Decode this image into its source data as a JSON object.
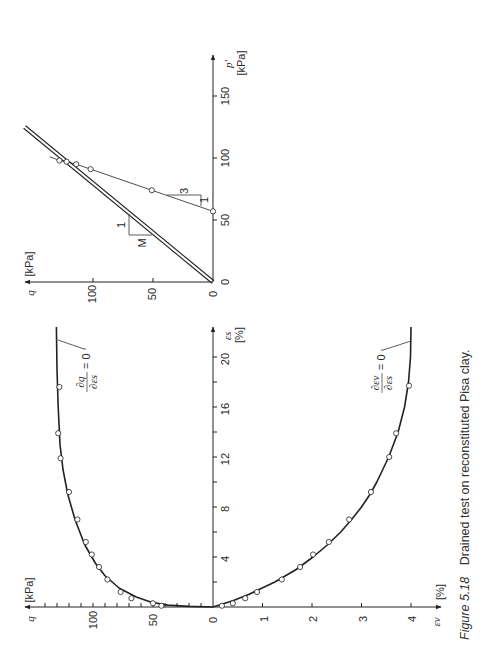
{
  "figure": {
    "caption_number": "Figure 5.18",
    "caption_text": "Drained test on reconstituted Pisa clay.",
    "colors": {
      "ink": "#222222",
      "background": "#ffffff"
    }
  },
  "chart_data": [
    {
      "id": "stress_path",
      "type": "line",
      "title": "",
      "xlabel": "p'",
      "xunit": "[kPa]",
      "ylabel": "q",
      "yunit": "[kPa]",
      "xlim": [
        0,
        175
      ],
      "ylim": [
        0,
        160
      ],
      "x_ticks": [
        0,
        50,
        100,
        150
      ],
      "y_ticks": [
        0,
        50,
        100
      ],
      "grid": false,
      "orientation_note": "figure rotated 90°; p' axis drawn vertical, q axis horizontal",
      "series": [
        {
          "name": "stress path (data)",
          "style": "markers+line",
          "points": [
            {
              "p": 57,
              "q": 0
            },
            {
              "p": 74,
              "q": 51
            },
            {
              "p": 91,
              "q": 102
            },
            {
              "p": 95,
              "q": 114
            },
            {
              "p": 97,
              "q": 122
            },
            {
              "p": 98,
              "q": 128
            }
          ],
          "line_extension_end": {
            "p": 101,
            "q": 136
          }
        },
        {
          "name": "critical state line",
          "style": "double-line",
          "points": [
            {
              "p": 0,
              "q": 0
            },
            {
              "p": 125,
              "q": 157
            }
          ]
        }
      ],
      "annotations": [
        {
          "type": "slope-triangle",
          "label_run": "1",
          "label_rise": "M",
          "slope": "M"
        },
        {
          "type": "slope-triangle",
          "label_run": "1",
          "label_rise": "3",
          "slope": "3"
        }
      ]
    },
    {
      "id": "q_vs_es",
      "type": "line",
      "xlabel": "εs",
      "xunit": "[%]",
      "ylabel": "q",
      "yunit": "[kPa]",
      "xlim": [
        0,
        22.5
      ],
      "ylim": [
        0,
        140
      ],
      "x_ticks": [
        0,
        4,
        8,
        12,
        16,
        20
      ],
      "x_minor_ticks": [
        2,
        6,
        10,
        14,
        18
      ],
      "y_ticks": [
        0,
        50,
        100
      ],
      "y_minor_step": 10,
      "grid": false,
      "series": [
        {
          "name": "data",
          "style": "markers",
          "points": [
            {
              "es": 0.1,
              "q": 43
            },
            {
              "es": 0.3,
              "q": 50
            },
            {
              "es": 0.7,
              "q": 68
            },
            {
              "es": 1.2,
              "q": 77
            },
            {
              "es": 2.2,
              "q": 88
            },
            {
              "es": 3.2,
              "q": 95
            },
            {
              "es": 4.2,
              "q": 101
            },
            {
              "es": 5.2,
              "q": 106
            },
            {
              "es": 7.0,
              "q": 113
            },
            {
              "es": 9.2,
              "q": 120
            },
            {
              "es": 11.9,
              "q": 127
            },
            {
              "es": 13.9,
              "q": 129
            },
            {
              "es": 17.6,
              "q": 128
            }
          ]
        },
        {
          "name": "model curve",
          "style": "line",
          "points": [
            {
              "es": 0,
              "q": 0
            },
            {
              "es": 0.05,
              "q": 20
            },
            {
              "es": 0.15,
              "q": 38
            },
            {
              "es": 0.4,
              "q": 52
            },
            {
              "es": 0.8,
              "q": 64
            },
            {
              "es": 1.5,
              "q": 78
            },
            {
              "es": 2.5,
              "q": 90
            },
            {
              "es": 3.5,
              "q": 98
            },
            {
              "es": 5,
              "q": 107
            },
            {
              "es": 7,
              "q": 115
            },
            {
              "es": 9,
              "q": 121
            },
            {
              "es": 11,
              "q": 125
            },
            {
              "es": 13,
              "q": 127.5
            },
            {
              "es": 16,
              "q": 129
            },
            {
              "es": 19,
              "q": 130
            },
            {
              "es": 22.4,
              "q": 130.5
            }
          ]
        }
      ],
      "annotations": [
        {
          "type": "leader",
          "label": "∂q/∂εs = 0",
          "numerator": "∂q",
          "denominator": "∂εs",
          "rhs": "= 0"
        }
      ]
    },
    {
      "id": "ev_vs_es",
      "type": "line",
      "xlabel": "εs",
      "xunit": "[%]",
      "ylabel": "εv",
      "yunit": "[%]",
      "xlim": [
        0,
        22.5
      ],
      "ylim": [
        0,
        4.5
      ],
      "y_ticks": [
        1,
        2,
        3,
        4
      ],
      "grid": false,
      "series": [
        {
          "name": "data",
          "style": "markers",
          "points": [
            {
              "es": 0.1,
              "ev": 0.18
            },
            {
              "es": 0.3,
              "ev": 0.4
            },
            {
              "es": 0.7,
              "ev": 0.65
            },
            {
              "es": 1.2,
              "ev": 0.89
            },
            {
              "es": 2.2,
              "ev": 1.39
            },
            {
              "es": 3.2,
              "ev": 1.76
            },
            {
              "es": 4.2,
              "ev": 2.02
            },
            {
              "es": 5.2,
              "ev": 2.34
            },
            {
              "es": 7.0,
              "ev": 2.75
            },
            {
              "es": 9.2,
              "ev": 3.19
            },
            {
              "es": 12.0,
              "ev": 3.56
            },
            {
              "es": 13.9,
              "ev": 3.7
            },
            {
              "es": 17.7,
              "ev": 3.96
            }
          ]
        },
        {
          "name": "model curve",
          "style": "line",
          "points": [
            {
              "es": 0,
              "ev": 0
            },
            {
              "es": 0.5,
              "ev": 0.4
            },
            {
              "es": 1,
              "ev": 0.72
            },
            {
              "es": 2,
              "ev": 1.25
            },
            {
              "es": 3,
              "ev": 1.68
            },
            {
              "es": 4,
              "ev": 2.02
            },
            {
              "es": 5,
              "ev": 2.32
            },
            {
              "es": 6,
              "ev": 2.58
            },
            {
              "es": 7,
              "ev": 2.8
            },
            {
              "es": 8,
              "ev": 3.0
            },
            {
              "es": 9,
              "ev": 3.17
            },
            {
              "es": 10,
              "ev": 3.31
            },
            {
              "es": 12,
              "ev": 3.55
            },
            {
              "es": 14,
              "ev": 3.74
            },
            {
              "es": 16,
              "ev": 3.87
            },
            {
              "es": 18,
              "ev": 3.95
            },
            {
              "es": 20,
              "ev": 3.99
            },
            {
              "es": 22.4,
              "ev": 4.0
            }
          ]
        }
      ],
      "annotations": [
        {
          "type": "leader",
          "label": "∂εv/∂εs = 0",
          "numerator": "∂εv",
          "denominator": "∂εs",
          "rhs": "= 0"
        }
      ]
    }
  ],
  "labels": {
    "top": {
      "p_axis_name": "p'",
      "p_axis_unit": "[kPa]",
      "q_axis_name": "q",
      "q_axis_unit": "[kPa]",
      "p_ticks": [
        "0",
        "50",
        "100",
        "150"
      ],
      "q_ticks": [
        "0",
        "50",
        "100"
      ],
      "tri_M_run": "1",
      "tri_M_rise": "M",
      "tri_3_rise": "3",
      "tri_3_run": "1"
    },
    "bottom": {
      "es_axis_name": "εs",
      "es_axis_unit": "[%]",
      "q_axis_name": "q",
      "q_axis_unit": "[kPa]",
      "ev_axis_name": "εv",
      "ev_axis_unit": "[%]",
      "es_ticks": [
        "4",
        "8",
        "12",
        "16",
        "20"
      ],
      "q_ticks": [
        "0",
        "50",
        "100"
      ],
      "ev_ticks": [
        "1",
        "2",
        "3",
        "4"
      ],
      "annot_q_num": "∂q",
      "annot_q_den": "∂εs",
      "annot_ev_num": "∂εv",
      "annot_ev_den": "∂εs",
      "annot_rhs": "= 0"
    }
  }
}
